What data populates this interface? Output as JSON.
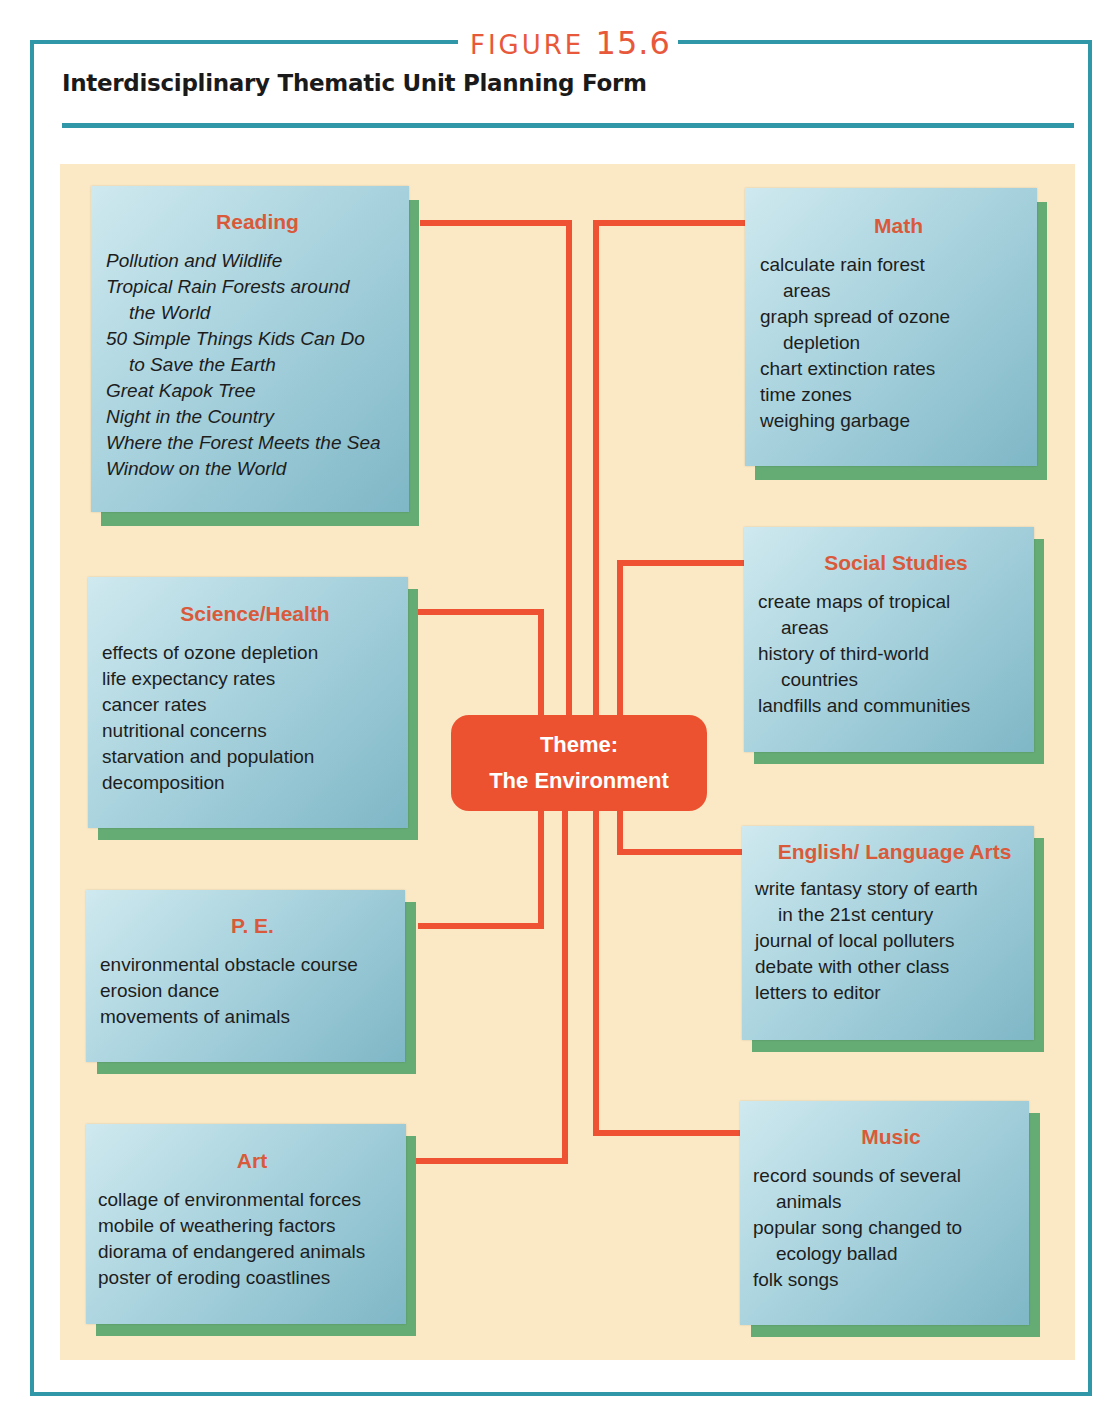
{
  "figure": {
    "label": "FIGURE",
    "number": "15.6"
  },
  "title": "Interdisciplinary Thematic Unit Planning Form",
  "theme": {
    "line1": "Theme:",
    "line2": "The Environment"
  },
  "colors": {
    "frame": "#2f97a8",
    "accent": "#ee5232",
    "heading": "#d95a3a",
    "card": "#a9d3de",
    "shadow": "#65ab74",
    "background": "#fbe9c6"
  },
  "subjects": {
    "reading": {
      "heading": "Reading",
      "items": [
        {
          "text": "Pollution and Wildlife",
          "cont": ""
        },
        {
          "text": "Tropical Rain Forests around",
          "cont": "the World"
        },
        {
          "text": "50 Simple Things Kids Can Do",
          "cont": "to Save the Earth"
        },
        {
          "text": "Great Kapok Tree",
          "cont": ""
        },
        {
          "text": "Night in the Country",
          "cont": ""
        },
        {
          "text": "Where the Forest Meets the Sea",
          "cont": ""
        },
        {
          "text": "Window on the World",
          "cont": ""
        }
      ]
    },
    "math": {
      "heading": "Math",
      "items": [
        {
          "text": "calculate rain forest",
          "cont": "areas"
        },
        {
          "text": "graph spread of ozone",
          "cont": "depletion"
        },
        {
          "text": "chart extinction rates",
          "cont": ""
        },
        {
          "text": "time zones",
          "cont": ""
        },
        {
          "text": "weighing garbage",
          "cont": ""
        }
      ]
    },
    "science": {
      "heading": "Science/Health",
      "items": [
        {
          "text": "effects of ozone depletion",
          "cont": ""
        },
        {
          "text": "life expectancy rates",
          "cont": ""
        },
        {
          "text": "cancer rates",
          "cont": ""
        },
        {
          "text": "nutritional concerns",
          "cont": ""
        },
        {
          "text": "starvation and population",
          "cont": ""
        },
        {
          "text": "decomposition",
          "cont": ""
        }
      ]
    },
    "social": {
      "heading": "Social Studies",
      "items": [
        {
          "text": "create maps of tropical",
          "cont": "areas"
        },
        {
          "text": "history of third-world",
          "cont": "countries"
        },
        {
          "text": "landfills and communities",
          "cont": ""
        }
      ]
    },
    "english": {
      "heading": "English/ Language Arts",
      "items": [
        {
          "text": "write fantasy story of earth",
          "cont": "in the 21st century"
        },
        {
          "text": "journal of local polluters",
          "cont": ""
        },
        {
          "text": "debate with other class",
          "cont": ""
        },
        {
          "text": "letters to editor",
          "cont": ""
        }
      ]
    },
    "pe": {
      "heading": "P. E.",
      "items": [
        {
          "text": "environmental obstacle course",
          "cont": ""
        },
        {
          "text": "erosion dance",
          "cont": ""
        },
        {
          "text": "movements of animals",
          "cont": ""
        }
      ]
    },
    "art": {
      "heading": "Art",
      "items": [
        {
          "text": "collage of environmental forces",
          "cont": ""
        },
        {
          "text": "mobile of weathering factors",
          "cont": ""
        },
        {
          "text": "diorama of endangered animals",
          "cont": ""
        },
        {
          "text": "poster of eroding coastlines",
          "cont": ""
        }
      ]
    },
    "music": {
      "heading": "Music",
      "items": [
        {
          "text": "record sounds of several",
          "cont": "animals"
        },
        {
          "text": "popular song changed to",
          "cont": "ecology ballad"
        },
        {
          "text": "folk songs",
          "cont": ""
        }
      ]
    }
  }
}
